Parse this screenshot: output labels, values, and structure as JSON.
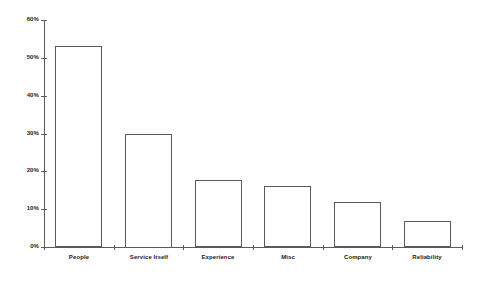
{
  "chart_data": {
    "type": "bar",
    "title": "",
    "subtitle": "",
    "xlabel": "",
    "ylabel": "",
    "categories": [
      "People",
      "Service Itself",
      "Experience",
      "Misc",
      "Company",
      "Reliability"
    ],
    "values": [
      53,
      30,
      17.8,
      16,
      11.8,
      6.8
    ],
    "ylim": [
      0,
      60
    ],
    "ytick_values": [
      0,
      10,
      20,
      30,
      40,
      50,
      60
    ],
    "ytick_labels": [
      "0%",
      "10%",
      "20%",
      "30%",
      "40%",
      "50%",
      "60%"
    ],
    "grid": false,
    "legend": null,
    "legend_position": "none",
    "bar_fill_color": "#ffffff",
    "bar_edge_color": "#5a5a5a",
    "axis_color": "#5a5a5a",
    "text_color": "#1a1a1a",
    "background_color": "#ffffff"
  }
}
